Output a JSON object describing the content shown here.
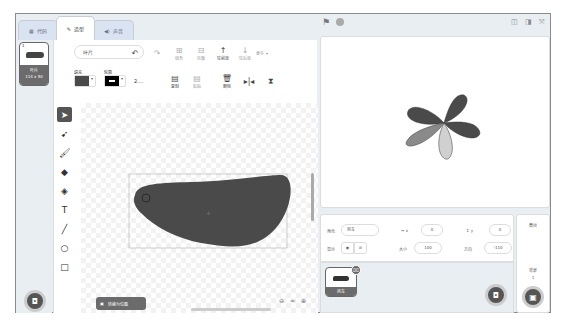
{
  "tabs": [
    {
      "label": "代码",
      "icon": "code-icon"
    },
    {
      "label": "造型",
      "icon": "brush-icon",
      "active": true
    },
    {
      "label": "声音",
      "icon": "speaker-icon"
    }
  ],
  "costumes": [
    {
      "index": "1",
      "name": "叶片",
      "size": "114 x 50"
    }
  ],
  "paint_editor": {
    "costume_name": "叶片",
    "undo_label": "",
    "group_label": "组合",
    "ungroup_label": "拆散",
    "forward_label": "往前放",
    "backward_label": "往后放",
    "more_label": "更多",
    "fill_label": "填充",
    "outline_label": "轮廓",
    "outline_width": "2....",
    "copy_label": "复制",
    "paste_label": "粘贴",
    "delete_label": "删除",
    "convert_label": "转换为位图",
    "fill_color": "#4a4a4a",
    "outline_color": "#000000",
    "zoom_reset": "="
  },
  "tools": [
    "select",
    "reshape",
    "brush",
    "eraser",
    "fill",
    "text",
    "line",
    "circle",
    "rectangle"
  ],
  "sprite_info": {
    "sprite_label": "角色",
    "sprite_name": "风车",
    "x_label": "x",
    "x_value": "0",
    "y_label": "y",
    "y_value": "0",
    "show_label": "显示",
    "size_label": "大小",
    "size_value": "100",
    "direction_label": "方向",
    "direction_value": "-110"
  },
  "sprites": [
    {
      "name": "风车"
    }
  ],
  "stage_pane": {
    "label": "舞台",
    "backdrops_label": "背景",
    "backdrops_count": "1"
  }
}
